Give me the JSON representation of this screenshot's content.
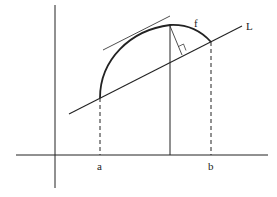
{
  "diagram": {
    "type": "geometry",
    "labels": {
      "curve": "f",
      "line": "L",
      "left_endpoint": "a",
      "right_endpoint": "b"
    },
    "colors": {
      "stroke": "#222222",
      "background": "#ffffff"
    },
    "elements": [
      "x-axis",
      "y-axis",
      "curve-f",
      "secant-line-L",
      "tangent-line",
      "vertical-from-peak",
      "perpendicular-to-L",
      "right-angle-marker",
      "dashed-vertical-a",
      "dashed-vertical-b"
    ]
  }
}
